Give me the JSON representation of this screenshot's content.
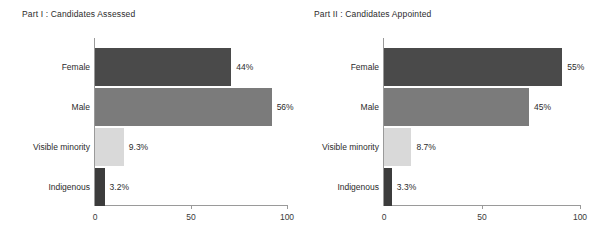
{
  "charts": [
    {
      "title": "Part I : Candidates Assessed",
      "categories": [
        "Female",
        "Male",
        "Visible minority",
        "Indigenous"
      ],
      "labels": [
        "44%",
        "56%",
        "9.3%",
        "3.2%"
      ],
      "bar_lengths": [
        71,
        92,
        15,
        5
      ],
      "colors": [
        "#4a4a4a",
        "#7b7b7b",
        "#d9d9d9",
        "#3c3c3c"
      ],
      "x_ticks": [
        "0",
        "50",
        "100"
      ],
      "x_tick_values": [
        0,
        50,
        100
      ],
      "xlim": [
        0,
        100
      ]
    },
    {
      "title": "Part II : Candidates Appointed",
      "categories": [
        "Female",
        "Male",
        "Visible minority",
        "Indigenous"
      ],
      "labels": [
        "55%",
        "45%",
        "8.7%",
        "3.3%"
      ],
      "bar_lengths": [
        91,
        74,
        14,
        4
      ],
      "colors": [
        "#4a4a4a",
        "#7b7b7b",
        "#d9d9d9",
        "#3c3c3c"
      ],
      "x_ticks": [
        "0",
        "50",
        "100"
      ],
      "x_tick_values": [
        0,
        50,
        100
      ],
      "xlim": [
        0,
        100
      ]
    }
  ],
  "chart_data": [
    {
      "type": "bar",
      "orientation": "horizontal",
      "title": "Part I : Candidates Assessed",
      "categories": [
        "Female",
        "Male",
        "Visible minority",
        "Indigenous"
      ],
      "values": [
        71,
        92,
        15,
        5
      ],
      "data_labels": [
        "44%",
        "56%",
        "9.3%",
        "3.2%"
      ],
      "xlabel": "",
      "ylabel": "",
      "xlim": [
        0,
        100
      ],
      "xticks": [
        0,
        50,
        100
      ],
      "grid": false,
      "legend": "none"
    },
    {
      "type": "bar",
      "orientation": "horizontal",
      "title": "Part II : Candidates Appointed",
      "categories": [
        "Female",
        "Male",
        "Visible minority",
        "Indigenous"
      ],
      "values": [
        91,
        74,
        14,
        4
      ],
      "data_labels": [
        "55%",
        "45%",
        "8.7%",
        "3.3%"
      ],
      "xlabel": "",
      "ylabel": "",
      "xlim": [
        0,
        100
      ],
      "xticks": [
        0,
        50,
        100
      ],
      "grid": false,
      "legend": "none"
    }
  ]
}
